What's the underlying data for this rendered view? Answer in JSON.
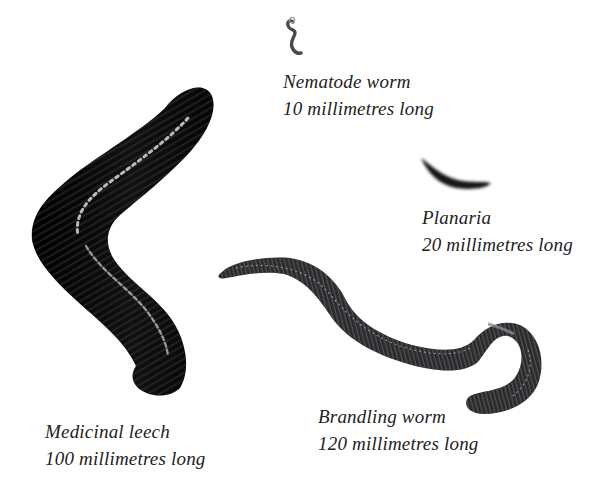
{
  "figure": {
    "background": "#ffffff",
    "text_color": "#222222",
    "specimens": [
      {
        "id": "nematode",
        "name": "Nematode worm",
        "length": "10 millimetres long",
        "color": "#4a4a4a"
      },
      {
        "id": "planaria",
        "name": "Planaria",
        "length": "20 millimetres long",
        "color": "#141414"
      },
      {
        "id": "leech",
        "name": "Medicinal leech",
        "length": "100 millimetres long",
        "color": "#0a0a0a"
      },
      {
        "id": "brandling",
        "name": "Brandling worm",
        "length": "120 millimetres long",
        "color": "#2a2a2c"
      }
    ]
  }
}
